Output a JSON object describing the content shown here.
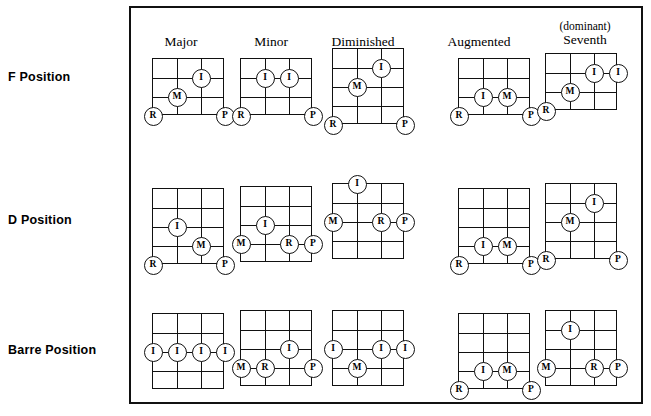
{
  "figure": {
    "colors": {
      "ink": "#111111",
      "paper": "#ffffff"
    }
  },
  "columns": [
    {
      "label": "Major",
      "label_small": ""
    },
    {
      "label": "Minor",
      "label_small": ""
    },
    {
      "label": "Diminished",
      "label_small": ""
    },
    {
      "label": "Augmented",
      "label_small": ""
    },
    {
      "label": "Seventh",
      "label_small": "(dominant)"
    }
  ],
  "rows": [
    {
      "label": "F Position"
    },
    {
      "label": "D Position"
    },
    {
      "label": "Barre Position"
    }
  ],
  "legend": {
    "R": "R",
    "I": "I",
    "M": "M",
    "P": "P"
  },
  "chart_data": {
    "type": "table",
    "row_categories": [
      "F Position",
      "D Position",
      "Barre Position"
    ],
    "column_categories": [
      "Major",
      "Minor",
      "Diminished",
      "Augmented",
      "(dominant) Seventh"
    ],
    "cells": [
      {
        "row": "F Position",
        "column": "Major",
        "strings": 4,
        "frets": 3,
        "markers": [
          {
            "finger": "I",
            "string": 2,
            "fret": 1
          },
          {
            "finger": "M",
            "string": 1,
            "fret": 2
          },
          {
            "finger": "R",
            "string": 0,
            "fret": 3
          },
          {
            "finger": "P",
            "string": 3,
            "fret": 3
          }
        ]
      },
      {
        "row": "F Position",
        "column": "Minor",
        "strings": 4,
        "frets": 3,
        "markers": [
          {
            "finger": "I",
            "string": 1,
            "fret": 1
          },
          {
            "finger": "I",
            "string": 2,
            "fret": 1
          },
          {
            "finger": "R",
            "string": 0,
            "fret": 3
          },
          {
            "finger": "P",
            "string": 3,
            "fret": 3
          }
        ]
      },
      {
        "row": "F Position",
        "column": "Diminished",
        "strings": 4,
        "frets": 4,
        "markers": [
          {
            "finger": "I",
            "string": 2,
            "fret": 1
          },
          {
            "finger": "M",
            "string": 1,
            "fret": 2
          },
          {
            "finger": "R",
            "string": 0,
            "fret": 4
          },
          {
            "finger": "P",
            "string": 3,
            "fret": 4
          }
        ]
      },
      {
        "row": "F Position",
        "column": "Augmented",
        "strings": 4,
        "frets": 3,
        "markers": [
          {
            "finger": "I",
            "string": 1,
            "fret": 2
          },
          {
            "finger": "M",
            "string": 2,
            "fret": 2
          },
          {
            "finger": "R",
            "string": 0,
            "fret": 3
          },
          {
            "finger": "P",
            "string": 3,
            "fret": 3
          }
        ]
      },
      {
        "row": "F Position",
        "column": "(dominant) Seventh",
        "strings": 4,
        "frets": 3,
        "markers": [
          {
            "finger": "I",
            "string": 2,
            "fret": 1
          },
          {
            "finger": "I",
            "string": 3,
            "fret": 1
          },
          {
            "finger": "M",
            "string": 1,
            "fret": 2
          },
          {
            "finger": "R",
            "string": 0,
            "fret": 3
          }
        ]
      },
      {
        "row": "D Position",
        "column": "Major",
        "strings": 4,
        "frets": 4,
        "markers": [
          {
            "finger": "I",
            "string": 1,
            "fret": 2
          },
          {
            "finger": "M",
            "string": 2,
            "fret": 3
          },
          {
            "finger": "R",
            "string": 0,
            "fret": 4
          },
          {
            "finger": "P",
            "string": 3,
            "fret": 4
          }
        ]
      },
      {
        "row": "D Position",
        "column": "Minor",
        "strings": 4,
        "frets": 4,
        "markers": [
          {
            "finger": "I",
            "string": 1,
            "fret": 2
          },
          {
            "finger": "M",
            "string": 0,
            "fret": 3
          },
          {
            "finger": "R",
            "string": 2,
            "fret": 3
          },
          {
            "finger": "P",
            "string": 3,
            "fret": 3
          }
        ]
      },
      {
        "row": "D Position",
        "column": "Diminished",
        "strings": 4,
        "frets": 4,
        "markers": [
          {
            "finger": "I",
            "string": 1,
            "fret": 0
          },
          {
            "finger": "M",
            "string": 0,
            "fret": 2
          },
          {
            "finger": "R",
            "string": 2,
            "fret": 2
          },
          {
            "finger": "P",
            "string": 3,
            "fret": 2
          }
        ]
      },
      {
        "row": "D Position",
        "column": "Augmented",
        "strings": 4,
        "frets": 4,
        "markers": [
          {
            "finger": "I",
            "string": 1,
            "fret": 3
          },
          {
            "finger": "M",
            "string": 2,
            "fret": 3
          },
          {
            "finger": "R",
            "string": 0,
            "fret": 4
          },
          {
            "finger": "P",
            "string": 3,
            "fret": 4
          }
        ]
      },
      {
        "row": "D Position",
        "column": "(dominant) Seventh",
        "strings": 4,
        "frets": 4,
        "markers": [
          {
            "finger": "I",
            "string": 2,
            "fret": 1
          },
          {
            "finger": "M",
            "string": 1,
            "fret": 2
          },
          {
            "finger": "R",
            "string": 0,
            "fret": 4
          },
          {
            "finger": "P",
            "string": 3,
            "fret": 4
          }
        ]
      },
      {
        "row": "Barre Position",
        "column": "Major",
        "strings": 4,
        "frets": 4,
        "markers": [
          {
            "finger": "I",
            "string": 0,
            "fret": 2
          },
          {
            "finger": "I",
            "string": 1,
            "fret": 2
          },
          {
            "finger": "I",
            "string": 2,
            "fret": 2
          },
          {
            "finger": "I",
            "string": 3,
            "fret": 2
          }
        ]
      },
      {
        "row": "Barre Position",
        "column": "Minor",
        "strings": 4,
        "frets": 4,
        "markers": [
          {
            "finger": "I",
            "string": 2,
            "fret": 2
          },
          {
            "finger": "M",
            "string": 0,
            "fret": 3
          },
          {
            "finger": "R",
            "string": 1,
            "fret": 3
          },
          {
            "finger": "P",
            "string": 3,
            "fret": 3
          }
        ]
      },
      {
        "row": "Barre Position",
        "column": "Diminished",
        "strings": 4,
        "frets": 4,
        "markers": [
          {
            "finger": "I",
            "string": 0,
            "fret": 2
          },
          {
            "finger": "I",
            "string": 2,
            "fret": 2
          },
          {
            "finger": "I",
            "string": 3,
            "fret": 2
          },
          {
            "finger": "M",
            "string": 1,
            "fret": 3
          }
        ]
      },
      {
        "row": "Barre Position",
        "column": "Augmented",
        "strings": 4,
        "frets": 4,
        "markers": [
          {
            "finger": "I",
            "string": 1,
            "fret": 3
          },
          {
            "finger": "M",
            "string": 2,
            "fret": 3
          },
          {
            "finger": "R",
            "string": 0,
            "fret": 4
          },
          {
            "finger": "P",
            "string": 3,
            "fret": 4
          }
        ]
      },
      {
        "row": "Barre Position",
        "column": "(dominant) Seventh",
        "strings": 4,
        "frets": 4,
        "markers": [
          {
            "finger": "I",
            "string": 1,
            "fret": 1
          },
          {
            "finger": "M",
            "string": 0,
            "fret": 3
          },
          {
            "finger": "R",
            "string": 2,
            "fret": 3
          },
          {
            "finger": "P",
            "string": 3,
            "fret": 3
          }
        ]
      }
    ]
  },
  "layout": {
    "column_x": [
      178,
      268,
      362,
      477,
      583
    ],
    "column_head_y": [
      33,
      33,
      33,
      33,
      26
    ],
    "row_label_y": [
      70,
      213,
      343
    ],
    "diagram_origin_x": [
      152,
      240,
      332,
      458,
      545
    ],
    "cell_w": 24,
    "cell_h": 19
  }
}
